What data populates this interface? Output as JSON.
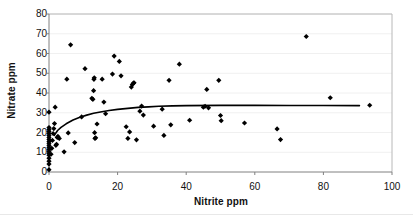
{
  "chart_data": {
    "type": "scatter",
    "title": "",
    "xlabel": "Nitrite ppm",
    "ylabel": "Nitrate ppm",
    "xlim": [
      0,
      100
    ],
    "ylim": [
      0,
      80
    ],
    "xticks": [
      0,
      20,
      40,
      60,
      80,
      100
    ],
    "yticks": [
      0,
      10,
      20,
      30,
      40,
      50,
      60,
      70,
      80
    ],
    "grid": "horizontal",
    "legend": "none",
    "marker": "diamond",
    "marker_color": "#000000",
    "trendline_color": "#000000",
    "points": [
      [
        0.0,
        1.2
      ],
      [
        0.0,
        4.0
      ],
      [
        0.0,
        5.5
      ],
      [
        0.0,
        7.0
      ],
      [
        0.0,
        8.5
      ],
      [
        0.0,
        9.5
      ],
      [
        0.0,
        10.5
      ],
      [
        0.0,
        11.5
      ],
      [
        0.0,
        12.5
      ],
      [
        0.0,
        13.5
      ],
      [
        0.0,
        14.5
      ],
      [
        0.0,
        15.5
      ],
      [
        0.0,
        16.5
      ],
      [
        0.0,
        17.5
      ],
      [
        0.0,
        18.5
      ],
      [
        0.0,
        19.5
      ],
      [
        0.0,
        20.5
      ],
      [
        0.0,
        21.5
      ],
      [
        0.0,
        22.5
      ],
      [
        0.0,
        30.3
      ],
      [
        0.6,
        9.0
      ],
      [
        0.8,
        12.0
      ],
      [
        1.0,
        16.0
      ],
      [
        1.2,
        19.5
      ],
      [
        1.4,
        22.0
      ],
      [
        1.6,
        24.5
      ],
      [
        1.8,
        32.8
      ],
      [
        2.0,
        13.5
      ],
      [
        2.2,
        14.0
      ],
      [
        2.4,
        17.5
      ],
      [
        2.6,
        18.0
      ],
      [
        3.0,
        17.0
      ],
      [
        4.4,
        10.2
      ],
      [
        5.2,
        47.0
      ],
      [
        5.6,
        19.8
      ],
      [
        6.3,
        64.4
      ],
      [
        7.5,
        14.9
      ],
      [
        9.5,
        27.9
      ],
      [
        10.5,
        52.3
      ],
      [
        12.5,
        37.3
      ],
      [
        12.8,
        36.8
      ],
      [
        13.0,
        41.2
      ],
      [
        13.1,
        46.9
      ],
      [
        13.2,
        47.7
      ],
      [
        13.3,
        19.9
      ],
      [
        13.4,
        17.0
      ],
      [
        13.6,
        17.3
      ],
      [
        14.0,
        24.3
      ],
      [
        15.5,
        47.0
      ],
      [
        16.0,
        35.4
      ],
      [
        16.5,
        29.5
      ],
      [
        18.5,
        49.6
      ],
      [
        19.0,
        58.7
      ],
      [
        20.5,
        56.0
      ],
      [
        21.0,
        48.7
      ],
      [
        22.5,
        22.9
      ],
      [
        23.0,
        17.0
      ],
      [
        23.5,
        20.3
      ],
      [
        24.0,
        43.0
      ],
      [
        24.3,
        44.3
      ],
      [
        24.6,
        45.0
      ],
      [
        24.8,
        45.2
      ],
      [
        25.5,
        16.3
      ],
      [
        26.5,
        30.8
      ],
      [
        27.0,
        33.4
      ],
      [
        27.5,
        28.8
      ],
      [
        30.5,
        23.2
      ],
      [
        33.0,
        31.8
      ],
      [
        33.5,
        18.5
      ],
      [
        35.0,
        46.4
      ],
      [
        35.5,
        23.9
      ],
      [
        38.0,
        54.6
      ],
      [
        41.0,
        26.2
      ],
      [
        45.0,
        32.8
      ],
      [
        45.5,
        33.3
      ],
      [
        46.0,
        41.8
      ],
      [
        46.5,
        32.5
      ],
      [
        49.5,
        46.4
      ],
      [
        50.0,
        28.6
      ],
      [
        50.2,
        26.0
      ],
      [
        57.0,
        24.8
      ],
      [
        66.5,
        21.8
      ],
      [
        67.5,
        16.4
      ],
      [
        75.0,
        68.6
      ],
      [
        82.0,
        37.6
      ],
      [
        93.5,
        33.8
      ]
    ],
    "trendline": {
      "description": "rising saturation curve",
      "points": [
        [
          1.5,
          18.5
        ],
        [
          2.5,
          21.0
        ],
        [
          3.5,
          22.6
        ],
        [
          5.0,
          24.4
        ],
        [
          7.0,
          26.3
        ],
        [
          9.0,
          27.7
        ],
        [
          11.0,
          28.8
        ],
        [
          13.0,
          29.7
        ],
        [
          15.0,
          30.4
        ],
        [
          17.5,
          31.1
        ],
        [
          20.0,
          31.7
        ],
        [
          23.0,
          32.2
        ],
        [
          26.0,
          32.7
        ],
        [
          29.0,
          33.0
        ],
        [
          32.0,
          33.3
        ],
        [
          36.0,
          33.5
        ],
        [
          40.0,
          33.6
        ],
        [
          50.0,
          33.75
        ],
        [
          60.0,
          33.75
        ],
        [
          70.0,
          33.7
        ],
        [
          80.0,
          33.65
        ],
        [
          90.5,
          33.6
        ]
      ]
    }
  }
}
